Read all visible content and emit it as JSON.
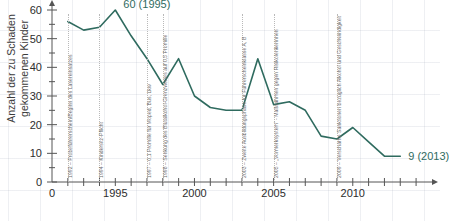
{
  "chart_data": {
    "type": "line",
    "title": "",
    "xlabel": "",
    "ylabel": "Anzahl der zu Schaden\ngekommenen Kinder",
    "xlim": [
      1991,
      2014.5
    ],
    "ylim": [
      0,
      62
    ],
    "grid": true,
    "legend": "none",
    "x": [
      1992,
      1993,
      1994,
      1995,
      1996,
      1997,
      1998,
      1999,
      2000,
      2001,
      2002,
      2003,
      2004,
      2005,
      2006,
      2007,
      2008,
      2009,
      2010,
      2011,
      2012,
      2013
    ],
    "values": [
      56,
      53,
      54,
      60,
      51,
      43,
      34,
      43,
      30,
      26,
      25,
      25,
      43,
      27,
      28,
      25,
      16,
      15,
      19,
      14,
      9,
      9
    ],
    "series_color": "#2f6b5f",
    "y_ticks": [
      0,
      10,
      20,
      30,
      40,
      50,
      60
    ],
    "x_ticks": [
      1995,
      2000,
      2005,
      2010
    ],
    "data_labels": [
      {
        "text": "60 (1995)",
        "x": 1995,
        "y": 60
      },
      {
        "text": "9 (2013)",
        "x": 2013,
        "y": 9
      }
    ],
    "annotations": [
      {
        "year": 1992,
        "text": "1992 – Probeführerschein/Beginn des Lasereinsatzes"
      },
      {
        "year": 1994,
        "text": "1994 – Kindersitz-Pflicht"
      },
      {
        "year": 1997,
        "text": "1997 – 0,1 Promille für Moped, Bus, Lkw"
      },
      {
        "year": 1998,
        "text": "1998 – Senkung des Blutalkohol-Grenzwertes auf 0,5 Promille"
      },
      {
        "year": 2003,
        "text": "2003 – Zweite Ausbildungsphase für Führerscheinklasse A, B"
      },
      {
        "year": 2005,
        "text": "2005 – „Vormerksystem“ - Maßnahmen gegen Risikolenkerinnen"
      },
      {
        "year": 2009,
        "text": "2009 – Verschärfte Sanktionen bezüglich Alkohol und Geschwindigkeit"
      }
    ]
  }
}
